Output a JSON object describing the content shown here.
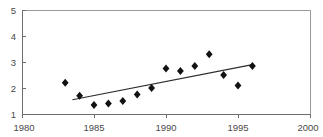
{
  "figure": {
    "background_color": "#ffffff",
    "width": 323,
    "height": 137,
    "title_sliver": "cropped title text above plot area"
  },
  "chart_data": {
    "type": "scatter",
    "title": "",
    "subtitle": "",
    "xlabel": "",
    "ylabel": "",
    "xlim": [
      1980,
      2000
    ],
    "ylim": [
      1,
      5
    ],
    "xticks": [
      1980,
      1985,
      1990,
      1995,
      2000
    ],
    "yticks": [
      1,
      2,
      3,
      4,
      5
    ],
    "xtick_labels": [
      "1980",
      "1985",
      "1990",
      "1995",
      "2000"
    ],
    "ytick_labels": [
      "1",
      "2",
      "3",
      "4",
      "5"
    ],
    "grid": false,
    "legend": false,
    "legend_position": "none",
    "marker_style": "diamond",
    "marker_color": "#121212",
    "marker_size": 4,
    "series": [
      {
        "name": "observations",
        "type": "scatter",
        "x": [
          1983,
          1984,
          1985,
          1986,
          1987,
          1988,
          1989,
          1990,
          1991,
          1992,
          1993,
          1994,
          1995,
          1996
        ],
        "values": [
          2.2,
          1.7,
          1.35,
          1.4,
          1.5,
          1.75,
          2.0,
          2.75,
          2.65,
          2.85,
          3.3,
          2.5,
          2.1,
          2.85
        ]
      },
      {
        "name": "trend",
        "type": "line",
        "color": "#2b2b2b",
        "x": [
          1983.5,
          1996.0
        ],
        "values": [
          1.55,
          2.9
        ]
      }
    ],
    "axis_color": "#6e6e6e",
    "frame_color": "#9a9a9a"
  }
}
